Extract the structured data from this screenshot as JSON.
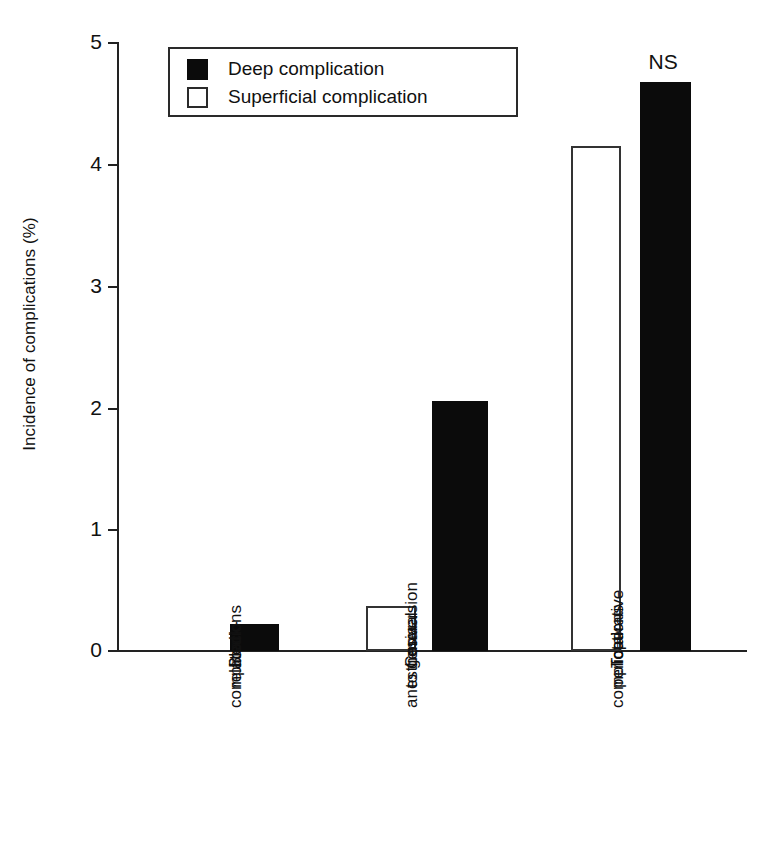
{
  "chart_data": {
    "type": "bar",
    "title": "",
    "subtitle": "",
    "xlabel": "",
    "ylabel": "Incidence of complications (%)",
    "ylim": [
      0,
      5
    ],
    "yticks": [
      "0",
      "1",
      "2",
      "3",
      "4",
      "5"
    ],
    "grid": false,
    "legend_position": "top-left",
    "categories": [
      "Block-related complications",
      "Conversion to general anesthesia",
      "Total perioperative complications"
    ],
    "category_label_lines": [
      [
        "Block-",
        "related",
        "complications"
      ],
      [
        "Conversion",
        "to general",
        "anesthesia"
      ],
      [
        "Total",
        "perioperative",
        "complications"
      ]
    ],
    "series": [
      {
        "name": "Deep complication",
        "color": "#0b0b0b",
        "values": [
          0.22,
          2.05,
          4.67
        ]
      },
      {
        "name": "Superficial complication",
        "color": "#ffffff",
        "values": [
          0,
          0.37,
          4.15
        ]
      }
    ],
    "annotations": [
      {
        "text": "NS",
        "category": "Total perioperative complications",
        "series": "Deep complication"
      }
    ]
  },
  "legend": {
    "items": [
      {
        "label": "Deep complication",
        "swatch": "filled-square"
      },
      {
        "label": "Superficial complication",
        "swatch": "hollow-square"
      }
    ]
  },
  "axis": {
    "y_title": "Incidence of complications (%)",
    "tick_0": "0",
    "tick_1": "1",
    "tick_2": "2",
    "tick_3": "3",
    "tick_4": "4",
    "tick_5": "5"
  },
  "annotation": {
    "ns": "NS"
  },
  "cat1": {
    "l0": "Block-",
    "l1": "related",
    "l2": "complications"
  },
  "cat2": {
    "l0": "Conversion",
    "l1": "to general",
    "l2": "anesthesia"
  },
  "cat3": {
    "l0": "Total",
    "l1": "perioperative",
    "l2": "complications"
  }
}
